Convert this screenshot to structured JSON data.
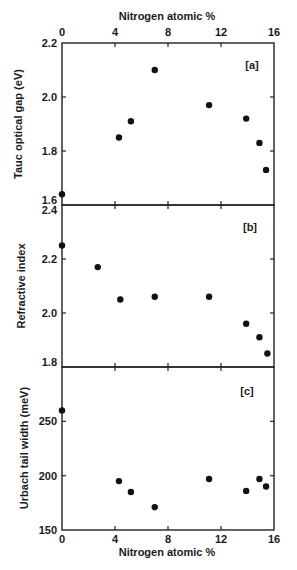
{
  "figure": {
    "top_xlabel": "Nitrogen atomic %",
    "bottom_xlabel": "Nitrogen atomic %",
    "x_ticks": [
      0,
      4,
      8,
      12,
      16
    ]
  },
  "chart_data": [
    {
      "type": "scatter",
      "panel": "[a]",
      "title": "",
      "xlabel": "Nitrogen atomic %",
      "ylabel": "Tauc optical gap (eV)",
      "xlim": [
        0,
        16
      ],
      "ylim": [
        1.6,
        2.2
      ],
      "x_ticks": [
        0,
        4,
        8,
        12,
        16
      ],
      "y_ticks": [
        1.6,
        1.8,
        2.0,
        2.2
      ],
      "y_tick_labels": [
        "1.6",
        "1.8",
        "2.0",
        "2.2"
      ],
      "grid": false,
      "x": [
        0,
        4.3,
        5.2,
        7.0,
        11.1,
        13.9,
        14.9,
        15.4
      ],
      "y": [
        1.64,
        1.85,
        1.91,
        2.1,
        1.97,
        1.92,
        1.83,
        1.73
      ]
    },
    {
      "type": "scatter",
      "panel": "[b]",
      "title": "",
      "xlabel": "Nitrogen atomic %",
      "ylabel": "Refractive index",
      "xlim": [
        0,
        16
      ],
      "ylim": [
        1.8,
        2.4
      ],
      "x_ticks": [
        0,
        4,
        8,
        12,
        16
      ],
      "y_ticks": [
        1.8,
        2.0,
        2.2,
        2.4
      ],
      "y_tick_labels": [
        "1.8",
        "2.0",
        "2.2",
        "2.4"
      ],
      "grid": false,
      "x": [
        0,
        2.7,
        4.4,
        7.0,
        11.1,
        13.9,
        14.9,
        15.5
      ],
      "y": [
        2.25,
        2.17,
        2.05,
        2.06,
        2.06,
        1.96,
        1.91,
        1.85
      ]
    },
    {
      "type": "scatter",
      "panel": "[c]",
      "title": "",
      "xlabel": "Nitrogen atomic %",
      "ylabel": "Urbach tail width (meV)",
      "xlim": [
        0,
        16
      ],
      "ylim": [
        150,
        300
      ],
      "x_ticks": [
        0,
        4,
        8,
        12,
        16
      ],
      "y_ticks": [
        150,
        200,
        250
      ],
      "y_tick_labels": [
        "150",
        "200",
        "250"
      ],
      "grid": false,
      "x": [
        0,
        4.3,
        5.2,
        7.0,
        11.1,
        13.9,
        14.9,
        15.4
      ],
      "y": [
        260,
        195,
        185,
        171,
        197,
        186,
        197,
        190
      ]
    }
  ]
}
